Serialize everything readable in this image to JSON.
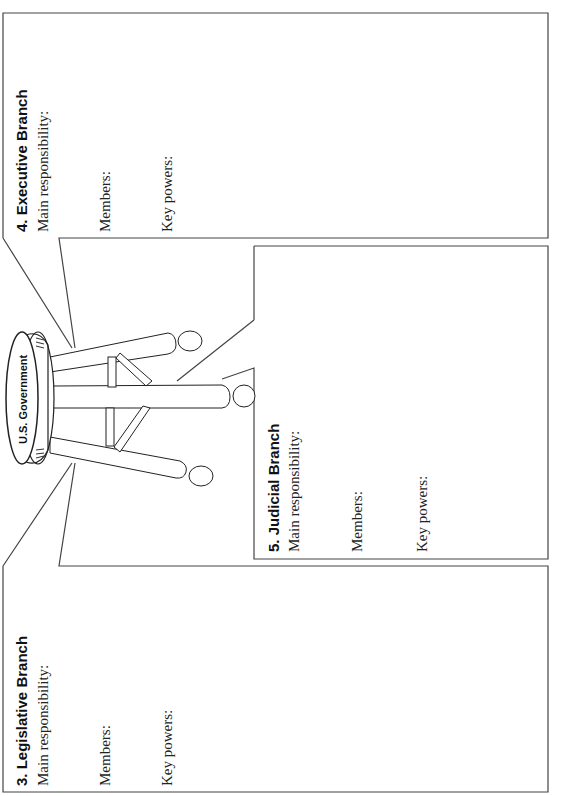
{
  "page": {
    "orientation": "rotated-90-ccw"
  },
  "stool": {
    "seat_label": "U.S. Government"
  },
  "branches": [
    {
      "id": "executive",
      "title": "4.  Executive Branch",
      "fields": [
        "Main responsibility:",
        "Members:",
        "Key powers:"
      ]
    },
    {
      "id": "judicial",
      "title": "5.  Judicial Branch",
      "fields": [
        "Main responsibility:",
        "Members:",
        "Key powers:"
      ]
    },
    {
      "id": "legislative",
      "title": "3.  Legislative Branch",
      "fields": [
        "Main responsibility:",
        "Members:",
        "Key powers:"
      ]
    }
  ]
}
